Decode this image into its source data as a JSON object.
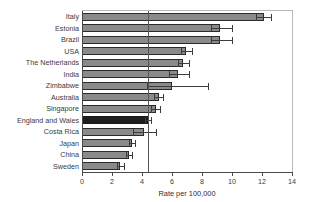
{
  "chart_data": {
    "type": "bar",
    "orientation": "horizontal",
    "title": "",
    "subtitle": "",
    "xlabel": "Rate per 100,000",
    "ylabel": "",
    "xlim": [
      0,
      14
    ],
    "xticks": [
      0,
      2,
      4,
      6,
      8,
      10,
      12,
      14
    ],
    "grid": false,
    "legend": null,
    "reference_line": {
      "value": 4.4,
      "label": ""
    },
    "highlight_category": "England and Wales",
    "colors": {
      "bar": "#8a8a8a",
      "bar_edge": "#2b2b2b",
      "highlight_bar": "#1e1e1e",
      "error_bar": "#3c3c3c",
      "axis": "#4a4a4a",
      "text": "#3a3a3a",
      "background": "#ffffff"
    },
    "categories": [
      "Italy",
      "Estonia",
      "Brazil",
      "USA",
      "The Netherlands",
      "India",
      "Zimbabwe",
      "Australia",
      "Singapore",
      "England and Wales",
      "Costa Rica",
      "Japan",
      "China",
      "Sweden"
    ],
    "values": [
      12.1,
      9.2,
      9.2,
      6.9,
      6.7,
      6.4,
      6.0,
      5.1,
      4.9,
      4.4,
      4.1,
      3.3,
      3.1,
      2.5
    ],
    "error_high": [
      12.6,
      10.0,
      10.0,
      7.3,
      7.1,
      7.1,
      8.4,
      5.4,
      5.2,
      4.6,
      4.9,
      3.5,
      3.3,
      2.8
    ],
    "error_low": [
      11.6,
      8.6,
      8.6,
      6.6,
      6.4,
      5.8,
      4.3,
      4.8,
      4.6,
      4.2,
      3.4,
      3.1,
      2.9,
      2.3
    ]
  }
}
